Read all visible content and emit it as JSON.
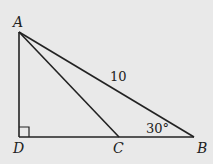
{
  "diagram": {
    "type": "geometry-triangle",
    "points": {
      "A": {
        "label": "A",
        "x": 19,
        "y": 32
      },
      "D": {
        "label": "D",
        "x": 19,
        "y": 137
      },
      "C": {
        "label": "C",
        "x": 119,
        "y": 137
      },
      "B": {
        "label": "B",
        "x": 194,
        "y": 137
      }
    },
    "segments": [
      "AD",
      "DB",
      "AB",
      "AC"
    ],
    "annotations": {
      "side_AB": "10",
      "angle_B": "30°",
      "right_angle_at": "D"
    },
    "colors": {
      "background": "#e9e9e9",
      "stroke": "#222222"
    }
  }
}
